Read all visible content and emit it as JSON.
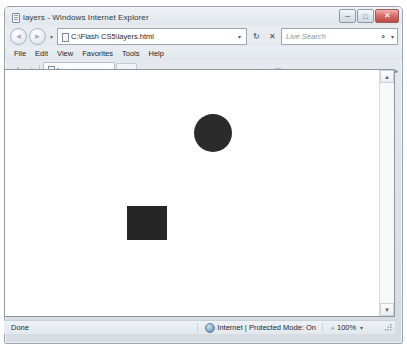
{
  "window": {
    "title": "layers - Windows Internet Explorer",
    "icon": "ie-document-icon",
    "controls": [
      {
        "name": "minimize-button",
        "glyph": "─"
      },
      {
        "name": "maximize-button",
        "glyph": "□"
      },
      {
        "name": "close-button",
        "glyph": "✕"
      }
    ]
  },
  "navigation": {
    "back_label": "◄",
    "forward_label": "►",
    "recent_pages_caret": "▾",
    "address_value": "C:\\Flash CS5\\layers.html",
    "address_caret": "▾",
    "refresh_glyph": "↻",
    "stop_glyph": "✕",
    "search_placeholder": "Live Search",
    "search_icon": "⌕",
    "search_caret": "▾"
  },
  "menubar": {
    "items": [
      {
        "label": "File"
      },
      {
        "label": "Edit"
      },
      {
        "label": "View"
      },
      {
        "label": "Favorites"
      },
      {
        "label": "Tools"
      },
      {
        "label": "Help"
      }
    ]
  },
  "tabbar": {
    "favorites_center_glyph": "★",
    "add_favorite_glyph": "☆",
    "tab_label": "layers",
    "new_tab_tooltip": ""
  },
  "commandbar": {
    "feeds_glyph": "◉",
    "feeds_caret": "▾",
    "print_glyph": "▣",
    "print_caret": "▾",
    "mail_glyph": "✉",
    "mail_caret": "▾",
    "page_icon": "○",
    "page_label": "Page",
    "page_caret": "▾",
    "tools_icon": "○",
    "tools_label": "Tools",
    "tools_caret": "▾",
    "overflow_glyph": "»"
  },
  "page": {
    "background": "#ffffff",
    "shapes": [
      {
        "name": "circle",
        "color": "#2b2b2b"
      },
      {
        "name": "square",
        "color": "#262626"
      }
    ],
    "scrollbar": {
      "up_glyph": "▲",
      "down_glyph": "▼"
    }
  },
  "statusbar": {
    "status_text": "Done",
    "zone_icon": "globe-icon",
    "zone_text": "Internet | Protected Mode: On",
    "zoom_icon": "⌕",
    "zoom_level": "100%",
    "zoom_caret": "▾"
  }
}
